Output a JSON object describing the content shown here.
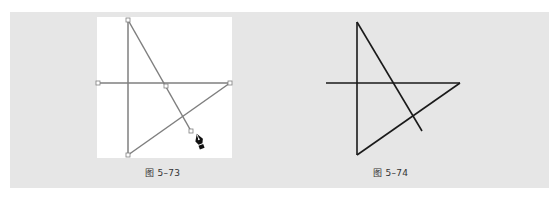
{
  "figures": [
    {
      "caption": "图 5–73",
      "state": "paths selected with pen tool, anchor points visible",
      "stroke_color": "#7a7a7a",
      "anchor_color": "#ffffff",
      "tool_cursor": "pen-tool-icon"
    },
    {
      "caption": "图 5–74",
      "state": "paths deselected, final stroke",
      "stroke_color": "#1a1a1a"
    }
  ],
  "colors": {
    "panel": "#e6e6e6",
    "canvas": "#ffffff",
    "page": "#ffffff"
  }
}
